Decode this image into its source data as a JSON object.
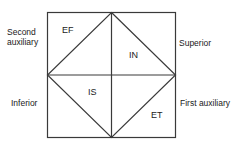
{
  "diagram": {
    "outer_labels": {
      "top_left_line1": "Second",
      "top_left_line2": "auxiliary",
      "right_upper": "Superior",
      "left_lower": "Inferior",
      "right_lower": "First auxiliary"
    },
    "regions": {
      "ef": "EF",
      "in": "IN",
      "is": "IS",
      "et": "ET"
    },
    "colors": {
      "line": "#3a3a3a",
      "text": "#1a1a1a",
      "background": "#ffffff"
    }
  }
}
